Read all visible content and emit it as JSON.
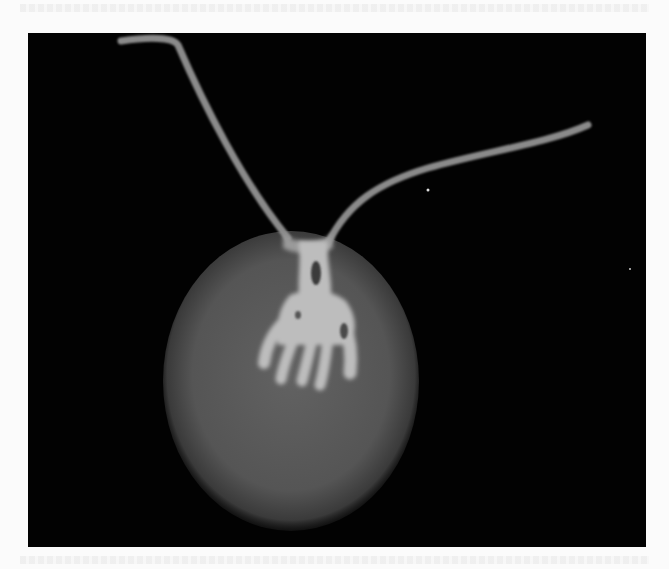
{
  "figure": {
    "colors": {
      "background": "#020202",
      "cell_body": "#5a5a5a",
      "internal_structure": "#bdbdbd",
      "flagella": "#8a8a8a"
    },
    "elements": [
      {
        "name": "cell-body",
        "shape": "oval"
      },
      {
        "name": "branched-structure",
        "shape": "hand-like branching"
      },
      {
        "name": "flagellum-left"
      },
      {
        "name": "flagellum-right"
      }
    ]
  }
}
